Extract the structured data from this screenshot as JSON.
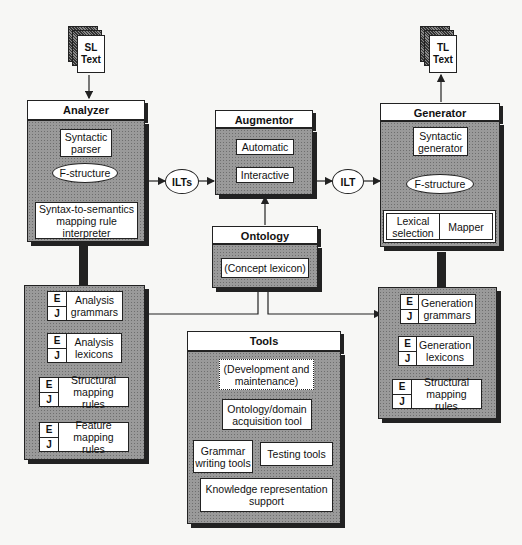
{
  "source_text": {
    "line1": "SL",
    "line2": "Text"
  },
  "target_text": {
    "line1": "TL",
    "line2": "Text"
  },
  "analyzer": {
    "title": "Analyzer",
    "syntactic_parser": "Syntactic parser",
    "f_structure": "F-structure",
    "mapping_interpreter": "Syntax-to-semantics mapping rule interpreter"
  },
  "ilts": "ILTs",
  "ilt": "ILT",
  "augmentor": {
    "title": "Augmentor",
    "automatic": "Automatic",
    "interactive": "Interactive"
  },
  "ontology": {
    "title": "Ontology",
    "concept_lexicon": "(Concept lexicon)"
  },
  "generator": {
    "title": "Generator",
    "syntactic_generator": "Syntactic generator",
    "f_structure": "F-structure",
    "lexical_selection": "Lexical selection",
    "mapper": "Mapper"
  },
  "analysis_resources": {
    "lang_top": "E",
    "lang_bottom": "J",
    "items": [
      "Analysis grammars",
      "Analysis lexicons",
      "Structural mapping rules",
      "Feature mapping rules"
    ]
  },
  "generation_resources": {
    "lang_top": "E",
    "lang_bottom": "J",
    "items": [
      "Generation grammars",
      "Generation lexicons",
      "Structural mapping rules"
    ]
  },
  "tools": {
    "title": "Tools",
    "dev_maintenance": "(Development and maintenance)",
    "ontology_tool": "Ontology/domain acquisition tool",
    "grammar_tools": "Grammar writing tools",
    "testing_tools": "Testing tools",
    "kr_support": "Knowledge representation support"
  }
}
